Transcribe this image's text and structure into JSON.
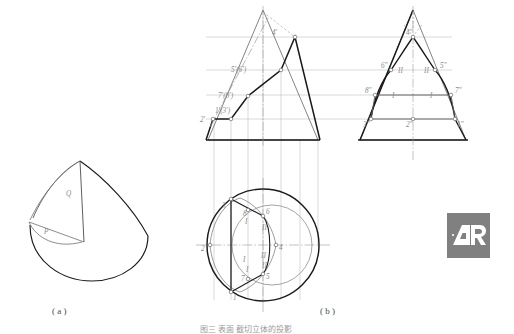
{
  "figure": {
    "title": "图三  表面 截切立体的投影",
    "captions": {
      "a": "( a )",
      "b": "( b )"
    }
  },
  "pictorial": {
    "name": "cone-pictorial",
    "labels": {
      "q_plane": "Q",
      "p_plane": "P"
    }
  },
  "front_view": {
    "name": "front-view",
    "labels": {
      "apex_cut": "4'",
      "pair_56": "5'(6')",
      "pair_78": "7'(8')",
      "pair_13": "1'(3')",
      "point2": "2'"
    }
  },
  "side_view": {
    "name": "side-view",
    "labels": {
      "p4": "4\"",
      "p6": "6\"",
      "p5": "5\"",
      "p8": "8\"",
      "p7": "7\"",
      "p3": "3\"",
      "p2": "2\"",
      "p1": "1\"",
      "tick_upper_left": "II",
      "tick_upper_right": "II",
      "tick_lower_left": "I",
      "tick_lower_right": "I"
    }
  },
  "top_view": {
    "name": "top-view",
    "labels": {
      "p3": "3",
      "p8": "8",
      "p6": "6",
      "p2": "2",
      "p4": "4",
      "p7": "7",
      "p5": "5",
      "p1": "1",
      "tick_8": "I",
      "tick_6": "II",
      "tick_mid_left": "I",
      "tick_mid_right": "II",
      "tick_7": "I",
      "tick_5": "II"
    }
  },
  "watermark": {
    "name": "ar-logo",
    "text": "AR",
    "box_color": "#808080",
    "glyph_color": "#ffffff"
  },
  "colors": {
    "outline_dark": "#1a1a1a",
    "construction": "#9a9a9a",
    "thin_line": "#7d7d7d",
    "projection": "#a8a8a8",
    "label": "#8a8a8a",
    "background": "#ffffff"
  }
}
